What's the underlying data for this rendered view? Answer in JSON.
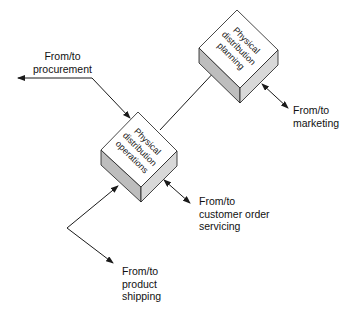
{
  "diagram": {
    "nodes": [
      {
        "id": "planning",
        "lines": [
          "Physical",
          "distribution",
          "planning"
        ]
      },
      {
        "id": "operations",
        "lines": [
          "Physical",
          "distribution",
          "operations"
        ]
      }
    ],
    "labels": {
      "procurement": [
        "From/to",
        "procurement"
      ],
      "marketing": [
        "From/to",
        "marketing"
      ],
      "customer": [
        "From/to",
        "customer order",
        "servicing"
      ],
      "shipping": [
        "From/to",
        "product",
        "shipping"
      ]
    },
    "colors": {
      "box_top": "#ffffff",
      "box_side": "#bdbdbd",
      "line": "#1a1a1a"
    }
  }
}
